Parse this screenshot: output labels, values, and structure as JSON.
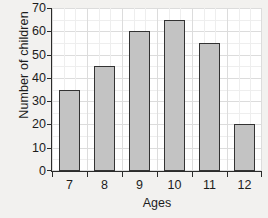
{
  "chart_data": {
    "type": "bar",
    "title": "",
    "categories": [
      "7",
      "8",
      "9",
      "10",
      "11",
      "12"
    ],
    "values": [
      35,
      45,
      60,
      65,
      55,
      20
    ],
    "xlabel": "Ages",
    "ylabel": "Number of children",
    "ylim": [
      0,
      70
    ],
    "y_ticks": [
      0,
      10,
      20,
      30,
      40,
      50,
      60,
      70
    ],
    "y_tick_labels": [
      "0",
      "10",
      "20",
      "30",
      "40",
      "50",
      "60",
      "70"
    ],
    "y_minor_step": 5,
    "grid": true,
    "grid_minor": true,
    "legend": "none",
    "series": [
      {
        "name": "Number of children",
        "values": [
          35,
          45,
          60,
          65,
          55,
          20
        ]
      }
    ]
  },
  "style": {
    "bar_fill": "#c3c3c3",
    "bar_stroke": "#333333",
    "axis_color": "#2b2b2b",
    "grid_major": "#dcdcdc",
    "grid_minor": "#eeeeee",
    "plot_background": "#ffffff",
    "page_background": "#f2f1ef",
    "text_color": "#1c1c1c"
  }
}
